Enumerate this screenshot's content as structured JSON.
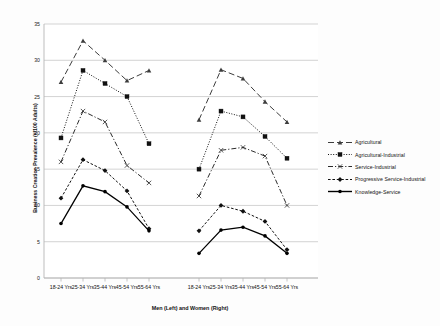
{
  "chart_data": {
    "type": "line",
    "title": "",
    "xlabel": "Men (Left) and Women (Right)",
    "ylabel": "Business Creation Prevalence (#/100 Adults)",
    "ylim": [
      0,
      35
    ],
    "ytick_step": 5,
    "yticks": [
      "0",
      "5",
      "10",
      "15",
      "20",
      "25",
      "30",
      "35"
    ],
    "grid": true,
    "legend_position": "right",
    "panels": [
      {
        "name": "Men (Left)",
        "categories": [
          "18-24 Yrs",
          "25-34 Yrs",
          "35-44 Yrs",
          "45-54 Yrs",
          "55-64 Yrs"
        ]
      },
      {
        "name": "Women (Right)",
        "categories": [
          "18-24 Yrs",
          "25-34 Yrs",
          "35-44 Yrs",
          "45-54 Yrs",
          "55-64 Yrs"
        ]
      }
    ],
    "categories": [
      "18-24 Yrs",
      "25-34 Yrs",
      "35-44 Yrs",
      "45-54 Yrs",
      "55-64 Yrs"
    ],
    "series": [
      {
        "name": "Agricultural",
        "marker": "triangle",
        "dash": "long-dash",
        "color": "#3d3d3d",
        "men": [
          27.0,
          32.7,
          30.0,
          27.2,
          28.6
        ],
        "women": [
          21.8,
          28.7,
          27.5,
          24.3,
          21.5
        ]
      },
      {
        "name": "Agricultural-Industrial",
        "marker": "square",
        "dash": "dotted",
        "color": "#111111",
        "men": [
          19.3,
          28.6,
          26.8,
          25.0,
          18.5
        ],
        "women": [
          15.0,
          23.0,
          22.2,
          19.5,
          16.5
        ]
      },
      {
        "name": "Service-Industrial",
        "marker": "x",
        "dash": "dash-dot",
        "color": "#2b2b2b",
        "men": [
          16.0,
          23.0,
          21.5,
          15.5,
          13.1
        ],
        "women": [
          11.3,
          17.6,
          18.0,
          16.8,
          10.0
        ]
      },
      {
        "name": "Progressive Service-Industrial",
        "marker": "diamond",
        "dash": "short-dash",
        "color": "#111111",
        "men": [
          11.0,
          16.3,
          14.8,
          12.0,
          6.8
        ],
        "women": [
          6.5,
          10.0,
          9.2,
          7.8,
          3.9
        ]
      },
      {
        "name": "Knowledge-Service",
        "marker": "circle",
        "dash": "solid",
        "color": "#000000",
        "men": [
          7.5,
          12.7,
          11.9,
          9.8,
          6.5
        ],
        "women": [
          3.4,
          6.6,
          7.0,
          5.8,
          3.4
        ]
      }
    ],
    "legend": [
      "Agricultural",
      "Agricultural-Industrial",
      "Service-Industrial",
      "Progressive Service-Industrial",
      "Knowledge-Service"
    ]
  }
}
